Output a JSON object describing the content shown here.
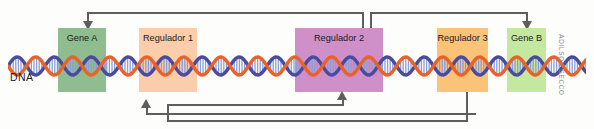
{
  "figure": {
    "kind": "gene-regulation-diagram",
    "dna_label": "DNA",
    "credit": "ADILSON SECCO",
    "background_color": "#fdfdfc",
    "connector_color": "#5e5e5e"
  },
  "regions": [
    {
      "id": "gene-a",
      "label": "Gene A",
      "type": "gene",
      "color": "#8fbd8f",
      "x": 58,
      "y": 28,
      "width": 48,
      "height": 64
    },
    {
      "id": "regulador-1",
      "label": "Regulador 1",
      "type": "regulator",
      "color": "#fbcdab",
      "x": 139,
      "y": 28,
      "width": 58,
      "height": 64
    },
    {
      "id": "regulador-2",
      "label": "Regulador 2",
      "type": "regulator",
      "color": "#cf8fc9",
      "x": 295,
      "y": 28,
      "width": 88,
      "height": 64
    },
    {
      "id": "regulador-3",
      "label": "Regulador 3",
      "type": "regulator",
      "color": "#fbc378",
      "x": 437,
      "y": 28,
      "width": 51,
      "height": 64
    },
    {
      "id": "gene-b",
      "label": "Gene B",
      "type": "gene",
      "color": "#c5e8a0",
      "x": 507,
      "y": 28,
      "width": 39,
      "height": 64
    }
  ],
  "helix": {
    "strand_a_color": "#e8622a",
    "strand_b_color": "#4a4a9e",
    "rung_color": "#8c9ed6",
    "period": 37,
    "amplitude": 9,
    "left": 8,
    "width": 578,
    "center_y": 66
  },
  "connectors": [
    {
      "id": "regulador2-to-geneA",
      "from": "regulador-2",
      "to": "gene-a",
      "effect": "regulates",
      "route": "top",
      "arrow": "down"
    },
    {
      "id": "regulador2-to-geneB",
      "from": "regulador-2",
      "to": "gene-b",
      "effect": "regulates",
      "route": "top",
      "arrow": "down"
    },
    {
      "id": "geneA-to-regulador1",
      "from": "gene-a",
      "to": "regulador-1",
      "effect": "regulates",
      "route": "bottom",
      "arrow": "up"
    },
    {
      "id": "regulador3-to-regulador2",
      "from": "regulador-3",
      "to": "regulador-2",
      "effect": "regulates",
      "route": "bottom",
      "arrow": "up"
    }
  ]
}
